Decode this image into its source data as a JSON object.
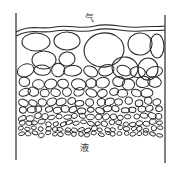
{
  "diagram": {
    "labels": {
      "gas": "气",
      "liquid": "液"
    },
    "colors": {
      "line": "#2a2a2a",
      "background": "#ffffff"
    },
    "walls": {
      "left": {
        "x": 16,
        "y1": 13,
        "y2": 160
      },
      "right": {
        "x": 165,
        "y1": 15,
        "y2": 163
      }
    },
    "surface_lines": [
      "M16,32 C30,24 40,30 55,27 C70,24 80,30 95,26 C110,22 125,29 140,27 C150,26 158,27 165,26",
      "M16,36 C30,28 40,34 55,31 C70,28 80,34 95,30 C110,26 125,33 140,31 C150,30 158,31 165,30"
    ],
    "bubble_rows": [
      {
        "y": 40,
        "rx": 11,
        "ry": 8,
        "count": 6
      },
      {
        "y": 56,
        "rx": 10,
        "ry": 8,
        "count": 7
      },
      {
        "y": 71,
        "rx": 8,
        "ry": 6,
        "count": 9
      },
      {
        "y": 83,
        "rx": 6.5,
        "ry": 5,
        "count": 11
      },
      {
        "y": 93,
        "rx": 5.5,
        "ry": 4.2,
        "count": 13
      },
      {
        "y": 102,
        "rx": 4.5,
        "ry": 3.5,
        "count": 15
      },
      {
        "y": 110,
        "rx": 4,
        "ry": 3,
        "count": 17
      },
      {
        "y": 117,
        "rx": 3.6,
        "ry": 2.7,
        "count": 19
      },
      {
        "y": 123,
        "rx": 3.2,
        "ry": 2.4,
        "count": 21
      },
      {
        "y": 129,
        "rx": 3,
        "ry": 2.2,
        "count": 22
      },
      {
        "y": 134,
        "rx": 2.8,
        "ry": 2,
        "count": 22
      }
    ],
    "large_bubbles": [
      {
        "cx": 36,
        "cy": 42,
        "rx": 14,
        "ry": 9
      },
      {
        "cx": 67,
        "cy": 41,
        "rx": 13,
        "ry": 9
      },
      {
        "cx": 104,
        "cy": 50,
        "rx": 20,
        "ry": 17
      },
      {
        "cx": 140,
        "cy": 44,
        "rx": 12,
        "ry": 11
      },
      {
        "cx": 157,
        "cy": 46,
        "rx": 7,
        "ry": 12
      },
      {
        "cx": 44,
        "cy": 60,
        "rx": 12,
        "ry": 9
      },
      {
        "cx": 67,
        "cy": 59,
        "rx": 8,
        "ry": 7
      },
      {
        "cx": 125,
        "cy": 68,
        "rx": 13,
        "ry": 11
      },
      {
        "cx": 148,
        "cy": 69,
        "rx": 10,
        "ry": 11
      }
    ]
  }
}
